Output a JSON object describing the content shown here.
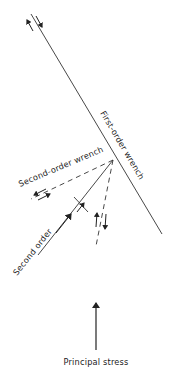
{
  "diagram": {
    "labels": {
      "first_order": "First-order wrench",
      "second_order_wrench": "Second-order wrench",
      "second_order": "Second order",
      "principal_stress": "Principal stress"
    },
    "colors": {
      "line": "#222222",
      "background": "#ffffff"
    }
  }
}
